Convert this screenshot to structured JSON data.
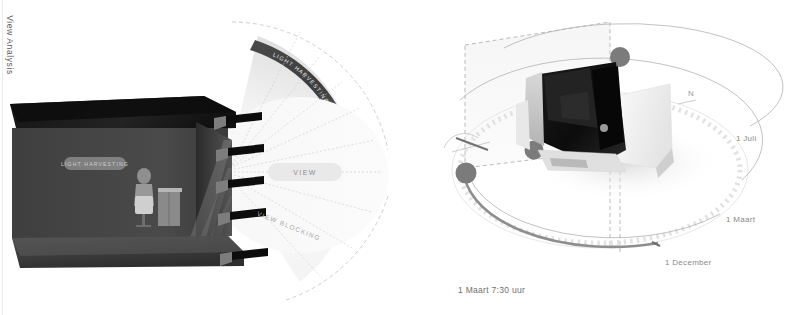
{
  "page": {
    "background": "#ffffff",
    "width": 791,
    "height": 315
  },
  "left_panel": {
    "side_label": "View Analysis",
    "interior_label": "LIGHT HARVESTING",
    "view_label": "VIEW",
    "view_blocking_label": "VIEW BLOCKING",
    "light_band_label": "LIGHT HARVESTING",
    "description": "Sectional perspective of an interior space with horizontal shading louvers, a seated occupant at a desk, and a radial fan of sightlines",
    "colors": {
      "interior_dark": "#3a3a3a",
      "ceiling_dark": "#1d1d1d",
      "louver": "#111111",
      "fan_light": "#f2f2f2",
      "band_dark": "#555555"
    }
  },
  "right_panel": {
    "side_label": "Sunlight Analysis",
    "compass_north": "N",
    "caption": "1 Maart 7:30 uur",
    "sun_paths": [
      {
        "label": "1 Juli"
      },
      {
        "label": "1 Maart"
      },
      {
        "label": "1 December"
      }
    ],
    "sun_markers": 3,
    "description": "Axonometric sun-path diagram with three seasonal solar arcs, a graduated compass ring and a shaded massing model",
    "colors": {
      "marker": "#7b7b7b",
      "path_line": "#b4b4b4",
      "dashed_plane": "#9a9a9a",
      "ring_tick": "#d2d2d2",
      "model_dark": "#141414",
      "model_light": "#f4f4f4"
    }
  }
}
